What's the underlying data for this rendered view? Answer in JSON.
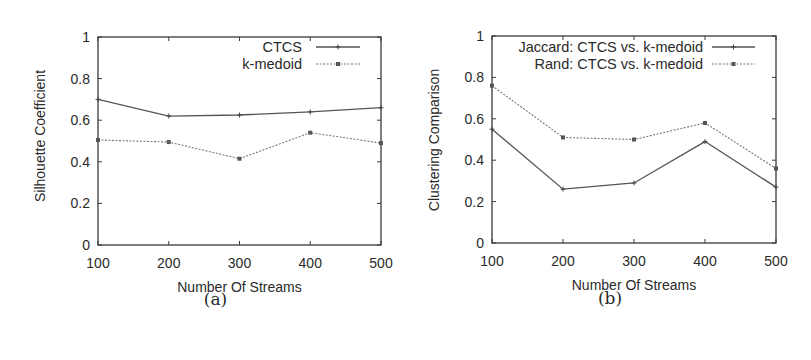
{
  "chart_data": [
    {
      "id": "a",
      "type": "line",
      "caption": "(a)",
      "title": "",
      "xlabel": "Number Of Streams",
      "ylabel": "Silhouette Coefficient",
      "x": [
        100,
        200,
        300,
        400,
        500
      ],
      "xticks": [
        "100",
        "200",
        "300",
        "400",
        "500"
      ],
      "yticks": [
        "0",
        "0.2",
        "0.4",
        "0.6",
        "0.8",
        "1"
      ],
      "ylim": [
        0,
        1
      ],
      "xlim": [
        100,
        500
      ],
      "grid": false,
      "legend_position": "top-right",
      "series": [
        {
          "name": "CTCS",
          "style": "solid",
          "marker": "plus",
          "values": [
            0.7,
            0.62,
            0.625,
            0.64,
            0.66
          ]
        },
        {
          "name": "k-medoid",
          "style": "dashed",
          "marker": "x-square",
          "values": [
            0.505,
            0.495,
            0.415,
            0.54,
            0.49
          ]
        }
      ]
    },
    {
      "id": "b",
      "type": "line",
      "caption": "(b)",
      "title": "",
      "xlabel": "Number Of Streams",
      "ylabel": "Clustering Comparison",
      "x": [
        100,
        200,
        300,
        400,
        500
      ],
      "xticks": [
        "100",
        "200",
        "300",
        "400",
        "500"
      ],
      "yticks": [
        "0",
        "0.2",
        "0.4",
        "0.6",
        "0.8",
        "1"
      ],
      "ylim": [
        0,
        1
      ],
      "xlim": [
        100,
        500
      ],
      "grid": false,
      "legend_position": "top-right",
      "series": [
        {
          "name": "Jaccard: CTCS vs. k-medoid",
          "style": "solid",
          "marker": "plus",
          "values": [
            0.55,
            0.26,
            0.29,
            0.49,
            0.27
          ]
        },
        {
          "name": "Rand: CTCS vs. k-medoid",
          "style": "dashed",
          "marker": "x-square",
          "values": [
            0.76,
            0.51,
            0.5,
            0.58,
            0.36
          ]
        }
      ]
    }
  ]
}
